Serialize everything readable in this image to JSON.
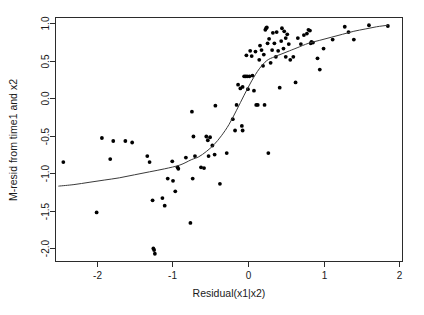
{
  "chart_data": {
    "type": "scatter",
    "title": "",
    "xlabel": "Residual(x1|x2)",
    "ylabel": "M-resid from time1 and x2",
    "xlim": [
      -2.55,
      2.05
    ],
    "ylim": [
      -2.18,
      1.08
    ],
    "xticks": [
      -2,
      -1,
      0,
      1,
      2
    ],
    "xtick_labels": [
      "-2",
      "-1",
      "0",
      "1",
      "2"
    ],
    "yticks": [
      1.0,
      0.5,
      0.0,
      -0.5,
      -1.0,
      -1.5,
      -2.0
    ],
    "ytick_labels": [
      "1.0",
      "0.5",
      "0.0",
      "-0.5",
      "-1.0",
      "-1.5",
      "-2.0"
    ],
    "grid": false,
    "legend": false,
    "point_color": "#000000",
    "point_radius": 1.9,
    "curve_color": "#3a3a3a",
    "frame_color": "#2b2b2b",
    "points": [
      [
        -2.44,
        -0.85
      ],
      [
        -2.0,
        -1.52
      ],
      [
        -1.93,
        -0.53
      ],
      [
        -1.82,
        -0.81
      ],
      [
        -1.78,
        -0.57
      ],
      [
        -1.62,
        -0.57
      ],
      [
        -1.53,
        -0.59
      ],
      [
        -1.33,
        -0.77
      ],
      [
        -1.3,
        -0.85
      ],
      [
        -1.26,
        -1.36
      ],
      [
        -1.25,
        -2.0
      ],
      [
        -1.24,
        -2.02
      ],
      [
        -1.23,
        -2.07
      ],
      [
        -1.13,
        -1.33
      ],
      [
        -1.1,
        -1.43
      ],
      [
        -1.06,
        -1.07
      ],
      [
        -1.0,
        -0.84
      ],
      [
        -0.99,
        -1.1
      ],
      [
        -0.96,
        -1.24
      ],
      [
        -0.93,
        -0.92
      ],
      [
        -0.92,
        -0.94
      ],
      [
        -0.82,
        -0.79
      ],
      [
        -0.76,
        -1.66
      ],
      [
        -0.74,
        -0.18
      ],
      [
        -0.73,
        -1.07
      ],
      [
        -0.72,
        -0.51
      ],
      [
        -0.7,
        -0.77
      ],
      [
        -0.62,
        -0.92
      ],
      [
        -0.58,
        -0.93
      ],
      [
        -0.55,
        -0.51
      ],
      [
        -0.53,
        -0.56
      ],
      [
        -0.52,
        -0.77
      ],
      [
        -0.5,
        -0.52
      ],
      [
        -0.47,
        -0.63
      ],
      [
        -0.44,
        -0.75
      ],
      [
        -0.43,
        -0.1
      ],
      [
        -0.37,
        -1.14
      ],
      [
        -0.28,
        -0.73
      ],
      [
        -0.2,
        -0.28
      ],
      [
        -0.17,
        -0.43
      ],
      [
        -0.15,
        -0.09
      ],
      [
        -0.13,
        0.18
      ],
      [
        -0.1,
        0.13
      ],
      [
        -0.08,
        -0.37
      ],
      [
        -0.07,
        -0.43
      ],
      [
        -0.07,
        0.15
      ],
      [
        -0.05,
        0.29
      ],
      [
        -0.03,
        0.29
      ],
      [
        -0.02,
        0.57
      ],
      [
        -0.01,
        0.29
      ],
      [
        0.0,
        0.12
      ],
      [
        0.02,
        0.29
      ],
      [
        0.03,
        0.63
      ],
      [
        0.05,
        0.56
      ],
      [
        0.06,
        0.3
      ],
      [
        0.08,
        0.1
      ],
      [
        0.1,
        0.62
      ],
      [
        0.11,
        -0.09
      ],
      [
        0.13,
        -0.09
      ],
      [
        0.15,
        0.51
      ],
      [
        0.16,
        0.7
      ],
      [
        0.18,
        0.64
      ],
      [
        0.2,
        0.43
      ],
      [
        0.21,
        0.58
      ],
      [
        0.22,
        -0.09
      ],
      [
        0.23,
        0.91
      ],
      [
        0.24,
        0.93
      ],
      [
        0.25,
        0.94
      ],
      [
        0.26,
        0.73
      ],
      [
        0.27,
        -0.73
      ],
      [
        0.28,
        0.79
      ],
      [
        0.3,
        0.47
      ],
      [
        0.32,
        0.64
      ],
      [
        0.33,
        0.87
      ],
      [
        0.35,
        0.73
      ],
      [
        0.37,
        0.55
      ],
      [
        0.38,
        0.88
      ],
      [
        0.4,
        0.63
      ],
      [
        0.42,
        0.14
      ],
      [
        0.44,
        0.76
      ],
      [
        0.45,
        0.93
      ],
      [
        0.47,
        0.66
      ],
      [
        0.48,
        0.89
      ],
      [
        0.5,
        0.8
      ],
      [
        0.5,
        0.55
      ],
      [
        0.52,
        0.85
      ],
      [
        0.54,
        0.72
      ],
      [
        0.56,
        0.51
      ],
      [
        0.6,
        0.55
      ],
      [
        0.63,
        0.21
      ],
      [
        0.66,
        0.8
      ],
      [
        0.7,
        0.72
      ],
      [
        0.74,
        0.84
      ],
      [
        0.78,
        0.86
      ],
      [
        0.8,
        0.91
      ],
      [
        0.82,
        0.9
      ],
      [
        0.83,
        0.73
      ],
      [
        0.84,
        0.75
      ],
      [
        0.86,
        0.74
      ],
      [
        0.92,
        0.53
      ],
      [
        0.95,
        0.38
      ],
      [
        1.0,
        0.66
      ],
      [
        1.12,
        0.78
      ],
      [
        1.28,
        0.95
      ],
      [
        1.33,
        0.88
      ],
      [
        1.4,
        0.78
      ],
      [
        1.6,
        0.97
      ],
      [
        1.85,
        0.96
      ]
    ],
    "curve": [
      [
        -2.5,
        -1.17
      ],
      [
        -2.3,
        -1.15
      ],
      [
        -2.1,
        -1.12
      ],
      [
        -1.9,
        -1.09
      ],
      [
        -1.7,
        -1.06
      ],
      [
        -1.5,
        -1.02
      ],
      [
        -1.3,
        -0.98
      ],
      [
        -1.1,
        -0.94
      ],
      [
        -0.9,
        -0.89
      ],
      [
        -0.75,
        -0.82
      ],
      [
        -0.65,
        -0.78
      ],
      [
        -0.55,
        -0.71
      ],
      [
        -0.45,
        -0.62
      ],
      [
        -0.35,
        -0.5
      ],
      [
        -0.25,
        -0.35
      ],
      [
        -0.15,
        -0.16
      ],
      [
        -0.05,
        0.04
      ],
      [
        0.05,
        0.23
      ],
      [
        0.15,
        0.39
      ],
      [
        0.25,
        0.5
      ],
      [
        0.35,
        0.55
      ],
      [
        0.45,
        0.59
      ],
      [
        0.55,
        0.63
      ],
      [
        0.65,
        0.67
      ],
      [
        0.8,
        0.73
      ],
      [
        0.95,
        0.77
      ],
      [
        1.1,
        0.81
      ],
      [
        1.25,
        0.85
      ],
      [
        1.4,
        0.89
      ],
      [
        1.55,
        0.92
      ],
      [
        1.7,
        0.95
      ],
      [
        1.85,
        0.97
      ]
    ]
  }
}
